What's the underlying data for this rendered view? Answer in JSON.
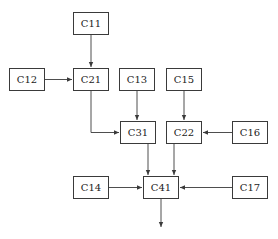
{
  "diagram": {
    "colors": {
      "stroke": "#3a3a3a",
      "text": "#222222",
      "background": "#ffffff"
    },
    "nodes": {
      "C11": {
        "label": "C11",
        "x": 73,
        "y": 12,
        "w": 36,
        "h": 23
      },
      "C12": {
        "label": "C12",
        "x": 9,
        "y": 68,
        "w": 36,
        "h": 23
      },
      "C21": {
        "label": "C21",
        "x": 73,
        "y": 68,
        "w": 36,
        "h": 23
      },
      "C13": {
        "label": "C13",
        "x": 119,
        "y": 68,
        "w": 36,
        "h": 23
      },
      "C15": {
        "label": "C15",
        "x": 166,
        "y": 68,
        "w": 36,
        "h": 23
      },
      "C31": {
        "label": "C31",
        "x": 120,
        "y": 121,
        "w": 36,
        "h": 23
      },
      "C22": {
        "label": "C22",
        "x": 166,
        "y": 121,
        "w": 36,
        "h": 23
      },
      "C16": {
        "label": "C16",
        "x": 232,
        "y": 121,
        "w": 36,
        "h": 23
      },
      "C14": {
        "label": "C14",
        "x": 73,
        "y": 176,
        "w": 36,
        "h": 23
      },
      "C41": {
        "label": "C41",
        "x": 143,
        "y": 176,
        "w": 36,
        "h": 23
      },
      "C17": {
        "label": "C17",
        "x": 232,
        "y": 176,
        "w": 36,
        "h": 23
      }
    },
    "edges": [
      {
        "from": "C11",
        "to": "C21"
      },
      {
        "from": "C12",
        "to": "C21"
      },
      {
        "from": "C21",
        "to": "C31"
      },
      {
        "from": "C13",
        "to": "C31"
      },
      {
        "from": "C15",
        "to": "C22"
      },
      {
        "from": "C16",
        "to": "C22"
      },
      {
        "from": "C31",
        "to": "C41"
      },
      {
        "from": "C22",
        "to": "C41"
      },
      {
        "from": "C14",
        "to": "C41"
      },
      {
        "from": "C17",
        "to": "C41"
      },
      {
        "from": "C41",
        "to": "output"
      }
    ]
  }
}
